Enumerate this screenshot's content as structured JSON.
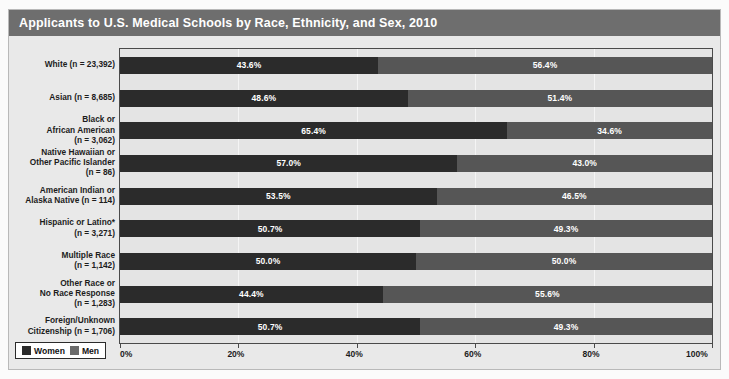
{
  "title": "Applicants to U.S. Medical Schools by Race, Ethnicity, and Sex, 2010",
  "legend": {
    "women_label": "Women",
    "men_label": "Men"
  },
  "colors": {
    "women": "#2b2b2b",
    "men": "#565656",
    "title_bar": "#6e6e6e",
    "plot_background": "#e4e4e4",
    "card_background": "#e9e9e9"
  },
  "chart_data": {
    "type": "bar",
    "title": "Applicants to U.S. Medical Schools by Race, Ethnicity, and Sex, 2010",
    "orientation": "horizontal",
    "stacked": true,
    "stacked_percent": true,
    "xlabel": "",
    "ylabel": "",
    "xlim": [
      0,
      100
    ],
    "grid": true,
    "legend_position": "bottom-left",
    "tick_labels": [
      "0%",
      "20%",
      "40%",
      "60%",
      "80%",
      "100%"
    ],
    "tick_values": [
      0,
      20,
      40,
      60,
      80,
      100
    ],
    "categories": [
      "White (n = 23,392)",
      "Asian (n = 8,685)",
      "Black or\nAfrican American\n(n = 3,062)",
      "Native Hawaiian or\nOther Pacific Islander\n(n = 86)",
      "American Indian or\nAlaska Native (n = 114)",
      "Hispanic or Latino*\n(n = 3,271)",
      "Multiple Race\n(n = 1,142)",
      "Other Race or\nNo Race Response\n(n = 1,283)",
      "Foreign/Unknown\nCitizenship (n = 1,706)"
    ],
    "series": [
      {
        "name": "Women",
        "values": [
          43.6,
          48.6,
          65.4,
          57.0,
          53.5,
          50.7,
          50.0,
          44.4,
          50.7
        ],
        "labels": [
          "43.6%",
          "48.6%",
          "65.4%",
          "57.0%",
          "53.5%",
          "50.7%",
          "50.0%",
          "44.4%",
          "50.7%"
        ]
      },
      {
        "name": "Men",
        "values": [
          56.4,
          51.4,
          34.6,
          43.0,
          46.5,
          49.3,
          50.0,
          55.6,
          49.3
        ],
        "labels": [
          "56.4%",
          "51.4%",
          "34.6%",
          "43.0%",
          "46.5%",
          "49.3%",
          "50.0%",
          "55.6%",
          "49.3%"
        ]
      }
    ]
  }
}
